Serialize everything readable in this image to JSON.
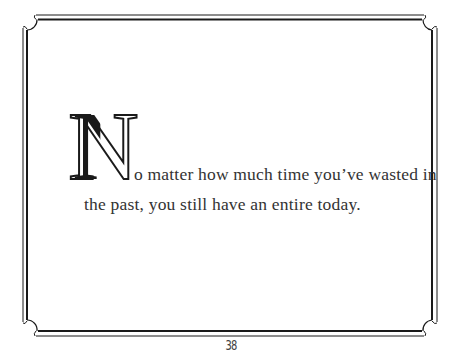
{
  "page": {
    "quote": {
      "drop_cap": "N",
      "line_1": "o matter how much time you’ve wasted in",
      "line_2": "the past, you still have an entire today."
    },
    "page_number": "38"
  },
  "colors": {
    "background": "#ffffff",
    "frame": "#1a1a1a",
    "text": "#333333"
  }
}
